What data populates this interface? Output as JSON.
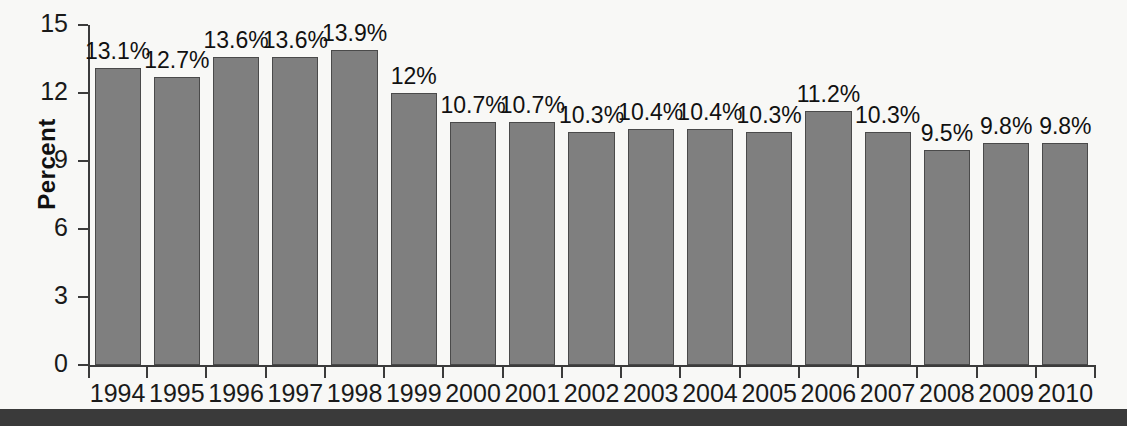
{
  "chart_data": {
    "type": "bar",
    "title": "",
    "subtitle": "",
    "xlabel": "",
    "ylabel": "Percent",
    "ylim": [
      0,
      15
    ],
    "yticks": [
      0,
      3,
      6,
      9,
      12,
      15
    ],
    "ytick_labels": [
      "0",
      "3",
      "6",
      "9",
      "12",
      "15"
    ],
    "grid": false,
    "legend": null,
    "categories": [
      "1994",
      "1995",
      "1996",
      "1997",
      "1998",
      "1999",
      "2000",
      "2001",
      "2002",
      "2003",
      "2004",
      "2005",
      "2006",
      "2007",
      "2008",
      "2009",
      "2010"
    ],
    "values": [
      13.1,
      12.7,
      13.6,
      13.6,
      13.9,
      12.0,
      10.7,
      10.7,
      10.3,
      10.4,
      10.4,
      10.3,
      11.2,
      10.3,
      9.5,
      9.8,
      9.8
    ],
    "data_labels": [
      "13.1%",
      "12.7%",
      "13.6%",
      "13.6%",
      "13.9%",
      "12%",
      "10.7%",
      "10.7%",
      "10.3%",
      "10.4%",
      "10.4%",
      "10.3%",
      "11.2%",
      "10.3%",
      "9.5%",
      "9.8%",
      "9.8%"
    ],
    "bar_color": "#7f7f7f",
    "bar_edge_color": "#4a4a4a",
    "background_color": "#f8f8f6",
    "axis_color": "#3b3b3b"
  }
}
